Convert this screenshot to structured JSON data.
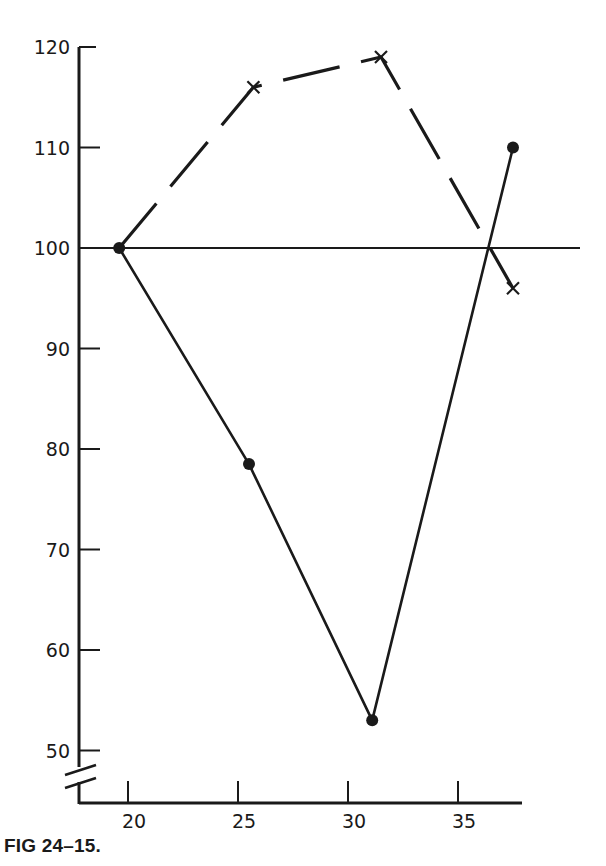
{
  "figure": {
    "caption": "FIG 24–15."
  },
  "chart_data": {
    "type": "line",
    "title": "",
    "xlabel": "",
    "ylabel": "",
    "xlim": [
      18,
      39
    ],
    "ylim": [
      46,
      121
    ],
    "x_ticks": [
      20,
      25,
      30,
      35
    ],
    "y_ticks": [
      50,
      60,
      70,
      80,
      90,
      100,
      110,
      120
    ],
    "y_axis_break": true,
    "reference_line": {
      "y": 100,
      "x_start": 18,
      "x_end": 40
    },
    "grid": false,
    "legend": null,
    "series": [
      {
        "name": "solid-line-dots",
        "style": "solid",
        "marker": "filled-circle",
        "color": "#1a1a1a",
        "x": [
          19.6,
          25.5,
          31.1,
          37.5
        ],
        "y": [
          100,
          78.5,
          53,
          110
        ]
      },
      {
        "name": "dashed-line-crosses",
        "style": "dashed",
        "marker": "x",
        "color": "#1a1a1a",
        "x": [
          19.6,
          25.7,
          31.5,
          37.5
        ],
        "y": [
          100,
          116,
          119,
          96
        ]
      }
    ]
  }
}
